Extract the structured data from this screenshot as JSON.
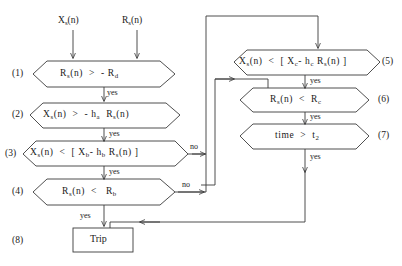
{
  "diagram": {
    "background_color": "#ffffff",
    "line_color": "#3b3b3b",
    "text_color": "#1a1a1a",
    "inputs": [
      {
        "name": "input-xs",
        "label": "X",
        "sub": "s",
        "tail": "(n)"
      },
      {
        "name": "input-rs",
        "label": "R",
        "sub": "s",
        "tail": "(n)"
      }
    ],
    "steps": [
      {
        "id": "1",
        "marker": "(1)",
        "shape": "hexagon",
        "text": "R_s(n) > - R_d"
      },
      {
        "id": "2",
        "marker": "(2)",
        "shape": "hexagon",
        "text": "X_s(n) > - h_a R_s(n)"
      },
      {
        "id": "3",
        "marker": "(3)",
        "shape": "hexagon",
        "text": "X_s(n) < [ X_b - h_b R_s(n) ]"
      },
      {
        "id": "4",
        "marker": "(4)",
        "shape": "hexagon",
        "text": "R_s(n) < R_b"
      },
      {
        "id": "5",
        "marker": "(5)",
        "shape": "hexagon",
        "text": "X_s(n) < [ X_c - h_c R_s(n) ]"
      },
      {
        "id": "6",
        "marker": "(6)",
        "shape": "hexagon",
        "text": "R_s(n) < R_c"
      },
      {
        "id": "7",
        "marker": "(7)",
        "shape": "hexagon",
        "text": "time > t_2"
      },
      {
        "id": "8",
        "marker": "(8)",
        "shape": "rectangle",
        "text": "Trip"
      }
    ],
    "edge_labels": {
      "yes_1_2": "yes",
      "yes_2_3": "yes",
      "yes_3_4": "yes",
      "yes_4_trip": "yes",
      "no_3": "no",
      "no_4": "no",
      "yes_5_6": "yes",
      "yes_6_7": "yes",
      "yes_7_trip": "yes"
    },
    "markers": {
      "m1": "(1)",
      "m2": "(2)",
      "m3": "(3)",
      "m4": "(4)",
      "m5": "(5)",
      "m6": "(6)",
      "m7": "(7)",
      "m8": "(8)"
    },
    "trip_label": "Trip"
  }
}
